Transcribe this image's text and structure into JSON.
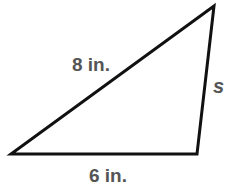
{
  "diagram": {
    "type": "triangle",
    "vertices": [
      [
        11,
        154
      ],
      [
        197,
        154
      ],
      [
        214,
        6
      ]
    ],
    "stroke_color": "#111111",
    "label_color": "#555555",
    "labels": {
      "hypotenuse": "8 in.",
      "base": "6 in.",
      "right_side": "s"
    }
  }
}
